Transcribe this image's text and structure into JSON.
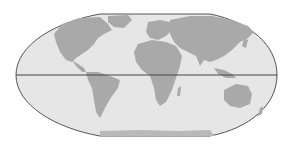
{
  "map": {
    "projection": "flat-polar pseudocylindrical world map",
    "colors": {
      "background": "#ffffff",
      "ocean": "#e6e6e6",
      "land": "#a9a9a9",
      "land_light": "#b9b9b9",
      "outline": "#555555",
      "equator": "#444444"
    },
    "features": {
      "equator_line": true,
      "continents": [
        "North America",
        "South America",
        "Europe",
        "Africa",
        "Asia",
        "Australia",
        "Antarctica",
        "Greenland"
      ]
    }
  }
}
